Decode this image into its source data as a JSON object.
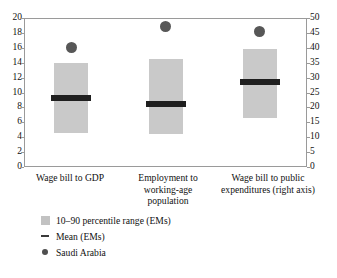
{
  "chart_data": {
    "type": "bar",
    "title": "",
    "subtitle": "",
    "xlabel": "",
    "ylabel": "",
    "grid": false,
    "legend_position": "bottom-left",
    "categories": [
      "Wage bill to GDP",
      "Employment to working-age population",
      "Wage bill to public expenditures (right axis)"
    ],
    "category_lines": [
      [
        "Wage bill to GDP"
      ],
      [
        "Employment to",
        "working-age",
        "population"
      ],
      [
        "Wage bill to public",
        "expenditures (right axis)"
      ]
    ],
    "axes": {
      "left": {
        "min": 0,
        "max": 20,
        "step": 2,
        "ticks": [
          0,
          2,
          4,
          6,
          8,
          10,
          12,
          14,
          16,
          18,
          20
        ],
        "tick_labels": [
          "0",
          "2",
          "4",
          "6",
          "8",
          "10",
          "12",
          "14",
          "16",
          "18",
          "20"
        ]
      },
      "right": {
        "min": 0,
        "max": 50,
        "step": 5,
        "ticks": [
          0,
          5,
          10,
          15,
          20,
          25,
          30,
          35,
          40,
          45,
          50
        ],
        "tick_labels": [
          "0",
          "5",
          "10",
          "15",
          "20",
          "25",
          "30",
          "35",
          "40",
          "45",
          "50"
        ]
      }
    },
    "series": [
      {
        "name": "10-90 percentile range (EMs)",
        "kind": "range",
        "color": "#c9c9c9",
        "values": [
          {
            "category": "Wage bill to GDP",
            "low": 4.6,
            "high": 13.9,
            "axis": "left"
          },
          {
            "category": "Employment to working-age population",
            "low": 4.4,
            "high": 14.5,
            "axis": "left"
          },
          {
            "category": "Wage bill to public expenditures (right axis)",
            "low": 16.5,
            "high": 39.5,
            "axis": "right"
          }
        ]
      },
      {
        "name": "Mean (EMs)",
        "kind": "marker-bar",
        "color": "#1f1f1f",
        "values": [
          {
            "category": "Wage bill to GDP",
            "value": 9.2,
            "axis": "left"
          },
          {
            "category": "Employment to working-age population",
            "value": 8.4,
            "axis": "left"
          },
          {
            "category": "Wage bill to public expenditures (right axis)",
            "value": 28.5,
            "axis": "right"
          }
        ]
      },
      {
        "name": "Saudi Arabia",
        "kind": "point",
        "color": "#575757",
        "values": [
          {
            "category": "Wage bill to GDP",
            "value": 16.1,
            "axis": "left"
          },
          {
            "category": "Employment to working-age population",
            "value": 18.8,
            "axis": "left"
          },
          {
            "category": "Wage bill to public expenditures (right axis)",
            "value": 45.5,
            "axis": "right"
          }
        ]
      }
    ]
  },
  "legend": {
    "items": [
      {
        "marker": "range-swatch-icon",
        "label": "10–90 percentile range (EMs)"
      },
      {
        "marker": "mean-dash-icon",
        "label": "Mean (EMs)"
      },
      {
        "marker": "saudi-dot-icon",
        "label": "Saudi Arabia"
      }
    ]
  },
  "colors": {
    "range_fill": "#c9c9c9",
    "mean_bar": "#1f1f1f",
    "saudi_point": "#575757",
    "frame": "#9a9a9a",
    "text": "#111111"
  }
}
